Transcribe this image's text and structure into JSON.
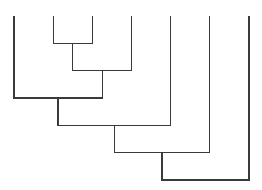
{
  "chart_data": {
    "type": "dendrogram",
    "title": "",
    "leaves": [
      "leaf-0",
      "leaf-1",
      "leaf-2",
      "leaf-3",
      "leaf-4",
      "leaf-5",
      "leaf-6"
    ],
    "leaf_labels_visible": false,
    "merges": [
      {
        "id": "n7",
        "left": 1,
        "right": 2,
        "height": 1
      },
      {
        "id": "n8",
        "left": "n7",
        "right": 3,
        "height": 2
      },
      {
        "id": "n9",
        "left": 0,
        "right": "n8",
        "height": 3
      },
      {
        "id": "n10",
        "left": "n9",
        "right": 4,
        "height": 4
      },
      {
        "id": "n11",
        "left": "n10",
        "right": 5,
        "height": 5
      },
      {
        "id": "n12",
        "left": "n11",
        "right": 6,
        "height": 6
      }
    ],
    "orientation": "root-bottom",
    "line_color": "#3a3a3a",
    "axes_visible": false
  }
}
